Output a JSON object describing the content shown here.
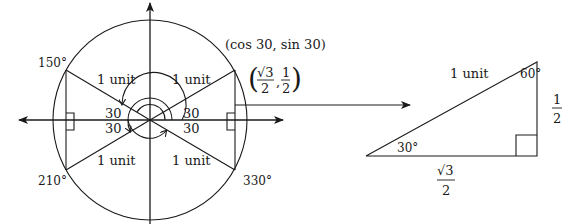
{
  "unit_circle": {
    "angle_labels": {
      "a150": "150°",
      "a210": "210°",
      "a330": "330°"
    },
    "hypotenuse_labels": {
      "upper_left": "1 unit",
      "upper_right": "1 unit",
      "lower_left": "1 unit",
      "lower_right": "1 unit"
    },
    "center_angle_labels": {
      "left_upper": "30",
      "left_lower": "30",
      "right_upper": "30",
      "right_lower": "30"
    },
    "point_label": "(cos 30, sin 30)",
    "point_value": {
      "x_numerator": "√3",
      "x_denominator": "2",
      "separator": ",",
      "y_numerator": "1",
      "y_denominator": "2",
      "open_paren": "(",
      "close_paren": ")"
    }
  },
  "reference_triangle": {
    "hypotenuse_label": "1 unit",
    "top_angle": "60°",
    "bottom_angle": "30°",
    "vertical_side": {
      "numerator": "1",
      "denominator": "2"
    },
    "horizontal_side": {
      "numerator": "√3",
      "denominator": "2"
    }
  },
  "colors": {
    "stroke": "#1a1a1a",
    "background": "#ffffff"
  }
}
